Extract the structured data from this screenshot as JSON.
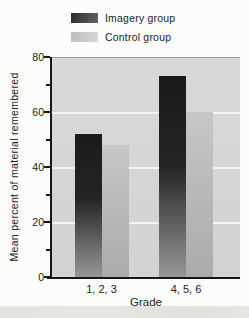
{
  "chart_data": {
    "type": "bar",
    "title": "",
    "categories": [
      "1, 2, 3",
      "4, 5, 6"
    ],
    "series": [
      {
        "name": "Imagery group",
        "values": [
          52,
          73
        ]
      },
      {
        "name": "Control group",
        "values": [
          48,
          60
        ]
      }
    ],
    "xlabel": "Grade",
    "ylabel": "Mean percent of material remembered",
    "ylim": [
      0,
      80
    ],
    "yticks_major": [
      0,
      20,
      40,
      60,
      80
    ],
    "yticks_minor": [
      10,
      30,
      50,
      70
    ],
    "gridlines": [
      20,
      40,
      60
    ],
    "legend_position": "top-left",
    "grid": "on",
    "colors": {
      "imagery_bar_top": "#1b1b1b",
      "imagery_bar_bottom": "#979797",
      "control_bar_top": "#c7c7c7",
      "control_bar_bottom": "#ababab",
      "plot_background": "#d6d6d6",
      "gridline": "#f3f3f0",
      "axis": "#161616",
      "page_background": "#fcfcfb",
      "bottom_strip": "#e3e4de"
    }
  },
  "legend": {
    "items": [
      {
        "label": "Imagery group",
        "swatch": "imagery"
      },
      {
        "label": "Control group",
        "swatch": "control"
      }
    ]
  }
}
